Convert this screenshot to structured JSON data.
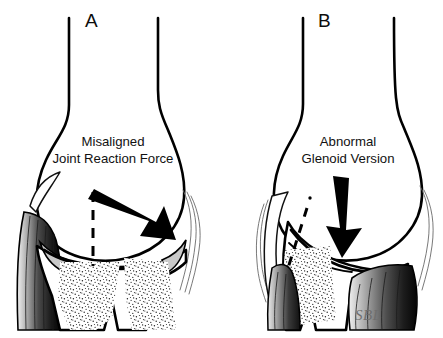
{
  "figure": {
    "background_color": "#ffffff",
    "width": 443,
    "height": 338
  },
  "panels": [
    {
      "id": "panel-a",
      "letter": "A",
      "caption_line1": "Misaligned",
      "caption_line2": "Joint Reaction Force",
      "reference_line": "vertical-dashed-axis",
      "arrow_direction": "down-right-diagonal",
      "glenoid_state": "normal-version"
    },
    {
      "id": "panel-b",
      "letter": "B",
      "caption_line1": "Abnormal",
      "caption_line2": "Glenoid Version",
      "reference_line": "oblique-dashed-axis",
      "arrow_direction": "downward-steep",
      "glenoid_state": "retroverted"
    }
  ],
  "signature": {
    "text": "SBL",
    "color": "#6f6f6f"
  },
  "palette": {
    "outline": "#000000",
    "cartilage": "#c9c9c9",
    "muscle_dark": "#1c1c1c",
    "muscle_light": "#e8e8e8",
    "stipple": "#2b2b2b",
    "background": "#ffffff"
  }
}
